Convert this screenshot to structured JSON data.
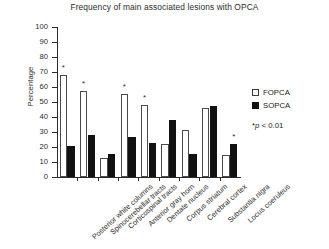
{
  "chart_data": {
    "type": "bar",
    "title": "Frequency of main associated lesions with OPCA",
    "xlabel": "",
    "ylabel": "Percentage",
    "ylim": [
      0,
      100
    ],
    "ytick_step": 10,
    "yticks": [
      0,
      10,
      20,
      30,
      40,
      50,
      60,
      70,
      80,
      90,
      100
    ],
    "ytick_labels": [
      "0",
      "10",
      "20",
      "30",
      "40",
      "50",
      "60",
      "70",
      "80",
      "90",
      "100"
    ],
    "grid": false,
    "legend_position": "right",
    "categories": [
      "Posterior white columns",
      "Spinocerebellar tracts",
      "Corticospinal tracts",
      "Anterior gray horn",
      "Dentate nucleus",
      "Corpus striatum",
      "Cerebral cortex",
      "Substantia nigra",
      "Locus coeruleus"
    ],
    "series": [
      {
        "name": "FOPCA",
        "color": "#ffffff",
        "edge_color": "#4a4a4a",
        "values": [
          68,
          57.5,
          13,
          55.5,
          48,
          22,
          31.5,
          46,
          14.5
        ]
      },
      {
        "name": "SOPCA",
        "color": "#111111",
        "edge_color": "#111111",
        "values": [
          21,
          28,
          15.5,
          27,
          22.5,
          38,
          15.5,
          47.5,
          22
        ]
      }
    ],
    "annotations": [
      {
        "label": "*",
        "category": "Posterior white columns",
        "series": "FOPCA",
        "value": 68
      },
      {
        "label": "*",
        "category": "Spinocerebellar tracts",
        "series": "FOPCA",
        "value": 57.5
      },
      {
        "label": "*",
        "category": "Anterior gray horn",
        "series": "FOPCA",
        "value": 55.5
      },
      {
        "label": "*",
        "category": "Dentate nucleus",
        "series": "FOPCA",
        "value": 48
      },
      {
        "label": "*",
        "category": "Locus coeruleus",
        "series": "SOPCA",
        "value": 22
      }
    ],
    "note": "*p < 0.01"
  },
  "legend": {
    "items": [
      {
        "label": "FOPCA",
        "swatch": "open-square"
      },
      {
        "label": "SOPCA",
        "swatch": "filled-square"
      }
    ],
    "note_star": "*",
    "note_p": "p",
    "note_rest": "< 0.01"
  }
}
